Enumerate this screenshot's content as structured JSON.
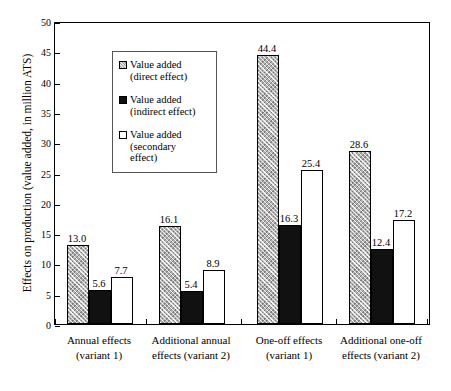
{
  "chart_data": {
    "type": "bar",
    "title": "",
    "xlabel": "",
    "ylabel": "Effects on production (value added, in million ATS)",
    "ylim": [
      0,
      50
    ],
    "ytick_step": 5,
    "grid": false,
    "legend_position": "top-left-inside",
    "categories": [
      "Annual effects\n(variant 1)",
      "Additional annual\neffects (variant 2)",
      "One-off effects\n(variant 1)",
      "Additional one-off\neffects (variant 2)"
    ],
    "category_lines": [
      [
        "Annual effects",
        "(variant 1)"
      ],
      [
        "Additional annual",
        "effects (variant 2)"
      ],
      [
        "One-off effects",
        "(variant 1)"
      ],
      [
        "Additional one-off",
        "effects (variant 2)"
      ]
    ],
    "series": [
      {
        "name": "Value added (direct effect)",
        "style": "hatched-gray",
        "values": [
          13.0,
          16.1,
          44.4,
          28.6
        ],
        "labels": [
          "13.0",
          "16.1",
          "44.4",
          "28.6"
        ]
      },
      {
        "name": "Value added (indirect effect)",
        "style": "solid-black",
        "values": [
          5.6,
          5.4,
          16.3,
          12.4
        ],
        "labels": [
          "5.6",
          "5.4",
          "16.3",
          "12.4"
        ]
      },
      {
        "name": "Value added (secondary effect)",
        "style": "white-outline",
        "values": [
          7.7,
          8.9,
          25.4,
          17.2
        ],
        "labels": [
          "7.7",
          "8.9",
          "25.4",
          "17.2"
        ]
      }
    ],
    "ytick_labels": [
      "0",
      "5",
      "10",
      "15",
      "20",
      "25",
      "30",
      "35",
      "40",
      "45",
      "50"
    ],
    "colors": {
      "direct": "#b3b3b3",
      "indirect": "#111111",
      "secondary": "#ffffff",
      "axis": "#000000",
      "text": "#000000"
    }
  },
  "legend": {
    "items": [
      {
        "line1": "Value added",
        "line2": "(direct effect)",
        "line3": "",
        "style": "direct"
      },
      {
        "line1": "Value added",
        "line2": "(indirect effect)",
        "line3": "",
        "style": "indirect"
      },
      {
        "line1": "Value added",
        "line2": "(secondary",
        "line3": "effect)",
        "style": "secondary"
      }
    ]
  },
  "axis": {
    "y_title": "Effects on production (value added, in million ATS)"
  }
}
